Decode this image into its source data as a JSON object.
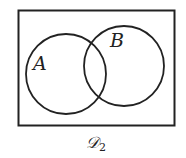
{
  "diagram": {
    "type": "venn",
    "universe_label": "𝒟",
    "universe_subscript": "2",
    "sets": [
      {
        "label": "A"
      },
      {
        "label": "B"
      }
    ],
    "colors": {
      "stroke": "#222222",
      "background": "#ffffff"
    }
  }
}
